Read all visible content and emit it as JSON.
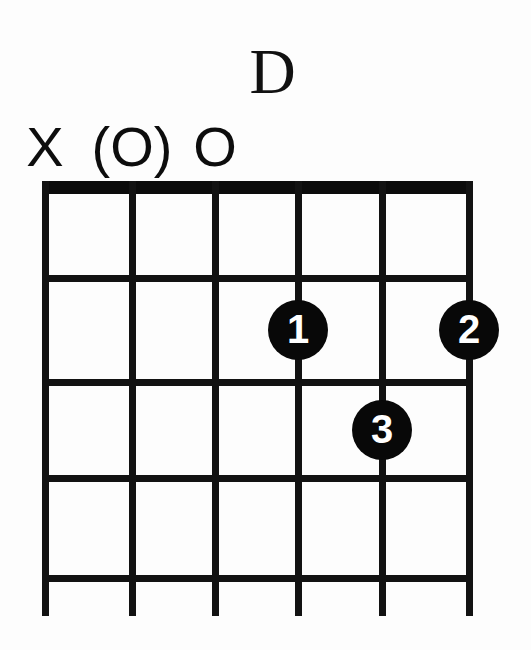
{
  "diagram": {
    "type": "guitar-chord-diagram",
    "chord_name": "D",
    "instrument": "guitar",
    "string_count": 6,
    "fret_count": 4,
    "starting_fret": 1,
    "colors": {
      "background": "#fdfdfd",
      "line": "#121212",
      "nut": "#0b0b0b",
      "dot_fill": "#080808",
      "dot_text": "#ffffff"
    },
    "string_markers": [
      {
        "string": 1,
        "label": "X",
        "meaning": "muted"
      },
      {
        "string": 2,
        "label": "(O)",
        "meaning": "optional-open"
      },
      {
        "string": 3,
        "label": "O",
        "meaning": "open"
      }
    ],
    "finger_positions": [
      {
        "finger": "1",
        "string": 4,
        "fret": 2
      },
      {
        "finger": "3",
        "string": 5,
        "fret": 3
      },
      {
        "finger": "2",
        "string": 6,
        "fret": 2
      }
    ],
    "geometry": {
      "string_x": [
        45,
        132,
        215,
        298,
        382,
        469
      ],
      "fret_y": [
        188,
        278,
        382,
        478,
        578
      ],
      "string_bottom_y": 616,
      "nut_top_y": 181,
      "nut_height": 13,
      "line_width": 7,
      "dot_radius": 30
    }
  }
}
